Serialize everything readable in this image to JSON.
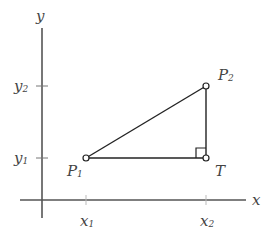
{
  "axes": {
    "x_label": "x",
    "y_label": "y",
    "x_ticks": [
      {
        "main": "x",
        "sub": "1"
      },
      {
        "main": "x",
        "sub": "2"
      }
    ],
    "y_ticks": [
      {
        "main": "y",
        "sub": "2"
      },
      {
        "main": "y",
        "sub": "1"
      }
    ]
  },
  "points": {
    "p1": {
      "main": "P",
      "sub": "1"
    },
    "p2": {
      "main": "P",
      "sub": "2"
    },
    "t": {
      "main": "T"
    }
  },
  "colors": {
    "axis": "#555555",
    "line": "#222222"
  }
}
